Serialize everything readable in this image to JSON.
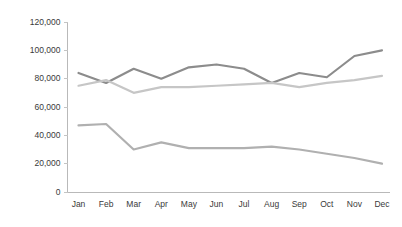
{
  "chart_data": {
    "type": "line",
    "title": "",
    "subtitle": "",
    "xlabel": "",
    "ylabel": "",
    "categories": [
      "Jan",
      "Feb",
      "Mar",
      "Apr",
      "May",
      "Jun",
      "Jul",
      "Aug",
      "Sep",
      "Oct",
      "Nov",
      "Dec"
    ],
    "ylim": [
      0,
      120000
    ],
    "ytick_values": [
      0,
      20000,
      40000,
      60000,
      80000,
      100000,
      120000
    ],
    "ytick_labels": [
      "0",
      "20,000",
      "40,000",
      "60,000",
      "80,000",
      "100,000",
      "120,000"
    ],
    "grid": false,
    "legend_position": "none",
    "series": [
      {
        "name": "series-1",
        "color": "#8c8c8c",
        "values": [
          84000,
          77000,
          87000,
          80000,
          88000,
          90000,
          87000,
          77000,
          84000,
          81000,
          96000,
          100000
        ]
      },
      {
        "name": "series-2",
        "color": "#c6c6c6",
        "values": [
          75000,
          79000,
          70000,
          74000,
          74000,
          75000,
          76000,
          77000,
          74000,
          77000,
          79000,
          82000
        ]
      },
      {
        "name": "series-3",
        "color": "#b0b0b0",
        "values": [
          47000,
          48000,
          30000,
          35000,
          31000,
          31000,
          31000,
          32000,
          30000,
          27000,
          24000,
          20000
        ]
      }
    ]
  },
  "colors": {
    "axis": "#b9b9b9",
    "tick": "#c4c4c4",
    "label_text": "#3a3a3a",
    "background": "#ffffff"
  }
}
